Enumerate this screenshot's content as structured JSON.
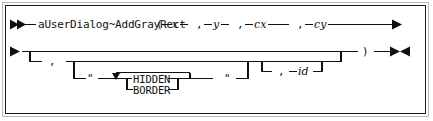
{
  "diagram": {
    "kind": "railroad-syntax-diagram",
    "colors": {
      "ink": "#101010",
      "outer_border": "#b8b8b8",
      "inner_border": "#1a1a1a",
      "background": "#ffffff"
    },
    "line1": {
      "start_marker": "►►",
      "method_name": "aUserDialog~AddGrayRect",
      "open_paren": "(",
      "params": [
        {
          "name": "x",
          "separator": ""
        },
        {
          "name": "y",
          "separator": ","
        },
        {
          "name": "cx",
          "separator": ","
        },
        {
          "name": "cy",
          "separator": ","
        }
      ],
      "continue_marker": "►"
    },
    "line2": {
      "start_marker": "►",
      "comma_optional": ",",
      "quote_open": "\"",
      "quote_close": "\"",
      "options": [
        "HIDDEN",
        "BORDER"
      ],
      "id_comma": ",",
      "id_name": "id",
      "close_paren": ")",
      "end_marker": "►◄"
    }
  }
}
